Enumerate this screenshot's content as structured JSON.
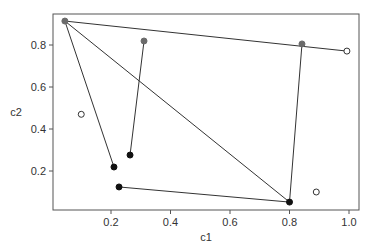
{
  "chart_data": {
    "type": "scatter",
    "title": "",
    "xlabel": "c1",
    "ylabel": "c2",
    "xlim": [
      0.02,
      1.03
    ],
    "ylim": [
      0.02,
      0.95
    ],
    "xticks": [
      0.2,
      0.4,
      0.6,
      0.8,
      1.0
    ],
    "xtick_labels": [
      "0.2",
      "0.4",
      "0.6",
      "0.8",
      "1.0"
    ],
    "yticks": [
      0.2,
      0.4,
      0.6,
      0.8
    ],
    "ytick_labels": [
      "0.2",
      "0.4",
      "0.6",
      "0.8"
    ],
    "grid": false,
    "legend": null,
    "points": [
      {
        "id": "A",
        "x": 0.045,
        "y": 0.914,
        "style": "gray-filled"
      },
      {
        "id": "B",
        "x": 0.311,
        "y": 0.819,
        "style": "gray-filled"
      },
      {
        "id": "C",
        "x": 0.842,
        "y": 0.805,
        "style": "gray-filled"
      },
      {
        "id": "D",
        "x": 0.993,
        "y": 0.771,
        "style": "open"
      },
      {
        "id": "E",
        "x": 0.1,
        "y": 0.47,
        "style": "open"
      },
      {
        "id": "F",
        "x": 0.21,
        "y": 0.219,
        "style": "black-filled"
      },
      {
        "id": "G",
        "x": 0.264,
        "y": 0.276,
        "style": "black-filled"
      },
      {
        "id": "H",
        "x": 0.227,
        "y": 0.124,
        "style": "black-filled"
      },
      {
        "id": "I",
        "x": 0.8,
        "y": 0.052,
        "style": "black-filled"
      },
      {
        "id": "J",
        "x": 0.89,
        "y": 0.1,
        "style": "open"
      }
    ],
    "segments": [
      [
        "A",
        "D"
      ],
      [
        "A",
        "F"
      ],
      [
        "A",
        "I"
      ],
      [
        "B",
        "G"
      ],
      [
        "C",
        "I"
      ],
      [
        "H",
        "I"
      ]
    ],
    "colors": {
      "gray-filled": "#6b6b6b",
      "black-filled": "#111111",
      "open": "#ffffff",
      "line": "#333333",
      "axis": "#555555"
    }
  }
}
